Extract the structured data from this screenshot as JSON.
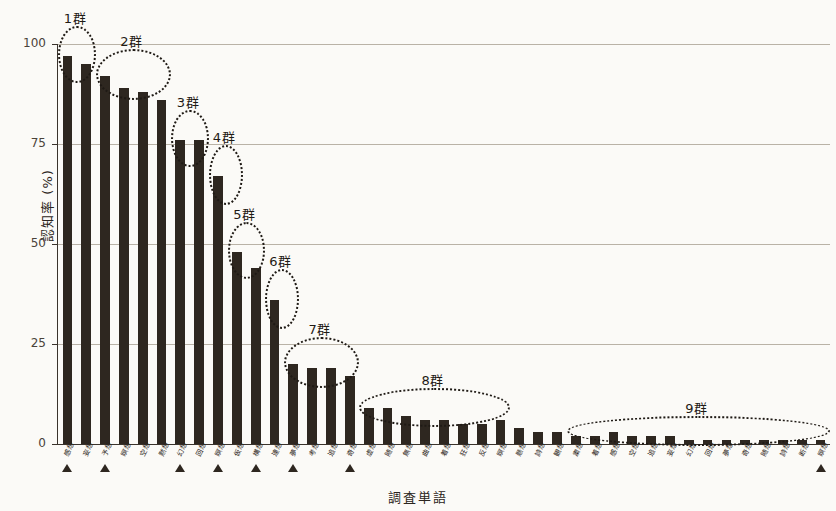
{
  "chart_data": {
    "type": "bar",
    "title": "",
    "xlabel": "調査単語",
    "ylabel": "認知率 (%)",
    "ylim": [
      0,
      100
    ],
    "yticks": [
      0,
      25,
      50,
      75,
      100
    ],
    "ytick_labels": [
      "0",
      "25",
      "50",
      "75",
      "100"
    ],
    "grid": true,
    "legend": "none",
    "bar_color": "#2e2720",
    "categories": [
      "感想",
      "妄想",
      "予想",
      "瞑想",
      "空想",
      "黙想",
      "幻想",
      "回想",
      "瞑想",
      "仮想",
      "構想",
      "連想",
      "夢想",
      "考想",
      "追想",
      "奇想",
      "虚想",
      "随想",
      "無想",
      "曲想",
      "着想",
      "狂想",
      "反想",
      "瞑想",
      "懸想",
      "詩想",
      "観想",
      "粛想",
      "着想",
      "感想",
      "空想",
      "追想",
      "妄想",
      "幻想",
      "回想",
      "夢想",
      "奇想",
      "随想",
      "詩想",
      "断想",
      "瞑想"
    ],
    "values": [
      97,
      95,
      92,
      89,
      88,
      86,
      76,
      76,
      67,
      48,
      44,
      36,
      20,
      19,
      19,
      17,
      9,
      9,
      7,
      6,
      6,
      5,
      5,
      6,
      4,
      3,
      3,
      2,
      2,
      3,
      2,
      2,
      2,
      1,
      1,
      1,
      1,
      1,
      1,
      1,
      1
    ],
    "marked_indices": [
      0,
      2,
      6,
      8,
      10,
      12,
      15,
      40
    ],
    "groups": [
      {
        "label": "1群",
        "start": 0,
        "end": 1
      },
      {
        "label": "2群",
        "start": 2,
        "end": 5
      },
      {
        "label": "3群",
        "start": 6,
        "end": 7
      },
      {
        "label": "4群",
        "start": 8,
        "end": 8
      },
      {
        "label": "5群",
        "start": 9,
        "end": 10
      },
      {
        "label": "6群",
        "start": 11,
        "end": 11
      },
      {
        "label": "7群",
        "start": 12,
        "end": 15
      },
      {
        "label": "8群",
        "start": 16,
        "end": 23
      },
      {
        "label": "9群",
        "start": 27,
        "end": 40
      }
    ]
  }
}
